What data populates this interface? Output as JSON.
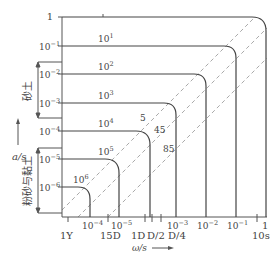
{
  "diagram": {
    "type": "log-log frequency/amplitude envelope diagram",
    "y_axis": {
      "label": "a/s",
      "ticks": [
        {
          "label": "1",
          "base": "1",
          "exp": ""
        },
        {
          "label": "10^-1",
          "base": "10",
          "exp": "−1"
        },
        {
          "label": "10^-2",
          "base": "10",
          "exp": "−2"
        },
        {
          "label": "10^-3",
          "base": "10",
          "exp": "−3"
        },
        {
          "label": "10^-4",
          "base": "10",
          "exp": "−4"
        },
        {
          "label": "10^-5",
          "base": "10",
          "exp": "−5"
        },
        {
          "label": "10^-6",
          "base": "10",
          "exp": "−6"
        }
      ]
    },
    "x_axis": {
      "label": "ω/s",
      "ticks": [
        {
          "label": "10^-4",
          "base": "10",
          "exp": "−4"
        },
        {
          "label": "10^-5",
          "base": "10",
          "exp": "−5"
        },
        {
          "label": "10^-3",
          "base": "10",
          "exp": "−3"
        },
        {
          "label": "10^-2",
          "base": "10",
          "exp": "−2"
        },
        {
          "label": "10^-1",
          "base": "10",
          "exp": "−1"
        },
        {
          "label": "1",
          "base": "1",
          "exp": ""
        }
      ],
      "time_marks": [
        "1Y",
        "15D",
        "1D",
        "D/2",
        "D/4",
        "10s"
      ]
    },
    "curves": [
      {
        "label": "1",
        "base": "",
        "exp": ""
      },
      {
        "label": "10^1",
        "base": "10",
        "exp": "1"
      },
      {
        "label": "10^2",
        "base": "10",
        "exp": "2"
      },
      {
        "label": "10^3",
        "base": "10",
        "exp": "3"
      },
      {
        "label": "10^4",
        "base": "10",
        "exp": "4"
      },
      {
        "label": "10^5",
        "base": "10",
        "exp": "5"
      },
      {
        "label": "10^6",
        "base": "10",
        "exp": "6"
      }
    ],
    "dashed_lines": [
      "5",
      "45",
      "85"
    ],
    "brackets": [
      {
        "label": "砂土"
      },
      {
        "label": "粉砂与黏土"
      }
    ]
  },
  "labels": {
    "y_axis_name": "a/s",
    "x_axis_name": "ω/s",
    "y1": "1",
    "y2b": "10",
    "y2e": "−1",
    "y3b": "10",
    "y3e": "−2",
    "y4b": "10",
    "y4e": "−3",
    "y5b": "10",
    "y5e": "−4",
    "y6b": "10",
    "y6e": "−5",
    "y7b": "10",
    "y7e": "−6",
    "x1b": "10",
    "x1e": "−4",
    "x2b": "10",
    "x2e": "−5",
    "x3b": "10",
    "x3e": "−3",
    "x4b": "10",
    "x4e": "−2",
    "x5b": "10",
    "x5e": "−1",
    "x6": "1",
    "t1": "1Y",
    "t2": "15D",
    "t3": "1D",
    "t4": "D/2",
    "t5": "D/4",
    "t6": "10s",
    "c1b": "10",
    "c1e": "1",
    "c2b": "10",
    "c2e": "2",
    "c3b": "10",
    "c3e": "3",
    "c4b": "10",
    "c4e": "4",
    "c5b": "10",
    "c5e": "5",
    "c6b": "10",
    "c6e": "6",
    "d1": "5",
    "d2": "45",
    "d3": "85",
    "sand": "砂土",
    "silt_clay": "粉砂与黏土"
  }
}
